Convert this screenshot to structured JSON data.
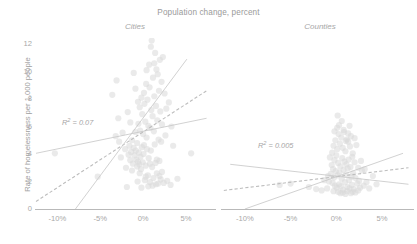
{
  "chart_data": {
    "type": "scatter",
    "title": "Population change, percent",
    "xlabel": "Population change, percent",
    "ylabel": "Rate of homelessness per 1,000 people",
    "xlim": [
      -12.5,
      8.5
    ],
    "ylim": [
      0,
      12.8
    ],
    "grid": false,
    "legend": "none",
    "xticks": [
      "-10%",
      "-5%",
      "0%",
      "5%"
    ],
    "xtick_values": [
      -10,
      -5,
      0,
      5
    ],
    "yticks": [
      "0",
      "2",
      "4",
      "6",
      "8",
      "10",
      "12"
    ],
    "ytick_values": [
      0,
      2,
      4,
      6,
      8,
      10,
      12
    ],
    "point_color": "#d8d8d8",
    "line_color": "#c9c9c9",
    "dash_line_color": "#bdbdbd",
    "panels": [
      {
        "name": "cities",
        "label": "Cities",
        "annotation": "R² = 0.07",
        "annotation_prefix": "R",
        "annotation_sup": "2",
        "annotation_suffix": " = 0.07",
        "r_squared": 0.07,
        "lines": [
          {
            "name": "shallow-fit",
            "style": "solid",
            "x0": -12.5,
            "y0": 4.05,
            "x1": 7.4,
            "y1": 6.6
          },
          {
            "name": "ols-fit",
            "style": "dashed",
            "x0": -12.5,
            "y0": 0.55,
            "x1": 7.4,
            "y1": 8.6
          },
          {
            "name": "steep-fit",
            "style": "solid",
            "x0": -7.9,
            "y0": 0.0,
            "x1": 5.1,
            "y1": 10.9
          }
        ],
        "points": [
          [
            -10.3,
            4.05
          ],
          [
            -5.3,
            2.35
          ],
          [
            -3.6,
            8.3
          ],
          [
            -3.2,
            5.3
          ],
          [
            -3.1,
            9.35
          ],
          [
            -2.9,
            6.6
          ],
          [
            -2.6,
            3.75
          ],
          [
            -2.4,
            5.55
          ],
          [
            -2.1,
            4.35
          ],
          [
            -1.9,
            1.6
          ],
          [
            -1.8,
            7.05
          ],
          [
            -1.7,
            3.95
          ],
          [
            -1.6,
            4.6
          ],
          [
            -1.5,
            3.55
          ],
          [
            -1.4,
            4.15
          ],
          [
            -1.3,
            5.0
          ],
          [
            -1.2,
            3.3
          ],
          [
            -1.1,
            4.45
          ],
          [
            -1.0,
            3.9
          ],
          [
            -0.9,
            8.75
          ],
          [
            -0.85,
            4.25
          ],
          [
            -0.8,
            3.6
          ],
          [
            -0.7,
            4.8
          ],
          [
            -0.65,
            2.0
          ],
          [
            -0.6,
            3.45
          ],
          [
            -0.55,
            6.2
          ],
          [
            -0.5,
            4.1
          ],
          [
            -0.45,
            3.25
          ],
          [
            -0.4,
            7.4
          ],
          [
            -0.35,
            5.7
          ],
          [
            -0.3,
            3.8
          ],
          [
            -0.25,
            2.9
          ],
          [
            -0.2,
            8.1
          ],
          [
            -0.15,
            4.5
          ],
          [
            -0.1,
            6.9
          ],
          [
            -0.05,
            3.4
          ],
          [
            0.0,
            5.45
          ],
          [
            0.05,
            4.0
          ],
          [
            0.1,
            8.45
          ],
          [
            0.15,
            7.65
          ],
          [
            0.2,
            2.1
          ],
          [
            0.25,
            6.35
          ],
          [
            0.3,
            3.15
          ],
          [
            0.35,
            9.1
          ],
          [
            0.4,
            5.2
          ],
          [
            0.45,
            4.35
          ],
          [
            0.5,
            7.95
          ],
          [
            0.55,
            2.45
          ],
          [
            0.6,
            6.05
          ],
          [
            0.65,
            3.7
          ],
          [
            0.7,
            10.5
          ],
          [
            0.75,
            8.85
          ],
          [
            0.8,
            1.95
          ],
          [
            0.85,
            5.9
          ],
          [
            0.9,
            4.25
          ],
          [
            0.95,
            7.2
          ],
          [
            1.0,
            12.25
          ],
          [
            1.05,
            3.05
          ],
          [
            1.1,
            6.75
          ],
          [
            1.15,
            9.55
          ],
          [
            1.2,
            2.25
          ],
          [
            1.25,
            5.65
          ],
          [
            1.3,
            8.2
          ],
          [
            1.35,
            4.7
          ],
          [
            1.4,
            11.35
          ],
          [
            1.45,
            3.35
          ],
          [
            1.5,
            7.5
          ],
          [
            1.55,
            10.15
          ],
          [
            1.6,
            2.6
          ],
          [
            1.65,
            6.45
          ],
          [
            1.7,
            9.8
          ],
          [
            1.75,
            1.85
          ],
          [
            1.8,
            5.05
          ],
          [
            1.85,
            8.6
          ],
          [
            1.9,
            3.5
          ],
          [
            1.95,
            10.85
          ],
          [
            2.0,
            7.1
          ],
          [
            2.05,
            2.15
          ],
          [
            2.1,
            4.9
          ],
          [
            2.15,
            9.25
          ],
          [
            2.2,
            6.15
          ],
          [
            2.3,
            11.05
          ],
          [
            2.4,
            1.9
          ],
          [
            2.5,
            8.4
          ],
          [
            2.6,
            5.35
          ],
          [
            2.8,
            2.05
          ],
          [
            3.0,
            7.75
          ],
          [
            3.2,
            1.75
          ],
          [
            3.5,
            4.6
          ],
          [
            4.0,
            2.2
          ],
          [
            5.6,
            4.05
          ],
          [
            0.6,
            1.65
          ],
          [
            1.1,
            1.7
          ],
          [
            1.5,
            1.8
          ],
          [
            -0.2,
            1.55
          ],
          [
            -1.3,
            2.8
          ],
          [
            -0.4,
            2.6
          ],
          [
            0.3,
            2.35
          ],
          [
            1.9,
            2.4
          ],
          [
            2.2,
            2.7
          ],
          [
            -2.0,
            3.0
          ],
          [
            -0.7,
            3.1
          ],
          [
            0.8,
            3.3
          ],
          [
            1.6,
            3.6
          ],
          [
            -1.1,
            9.9
          ],
          [
            0.4,
            10.1
          ],
          [
            1.3,
            10.6
          ],
          [
            0.9,
            11.8
          ],
          [
            -0.6,
            7.8
          ],
          [
            -1.5,
            6.3
          ],
          [
            2.7,
            7.3
          ],
          [
            -2.8,
            4.9
          ],
          [
            3.3,
            6.0
          ],
          [
            -0.9,
            5.6
          ],
          [
            0.1,
            4.65
          ]
        ]
      },
      {
        "name": "counties",
        "label": "Counties",
        "annotation": "R² = 0.005",
        "annotation_prefix": "R",
        "annotation_sup": "2",
        "annotation_suffix": " = 0.005",
        "r_squared": 0.005,
        "lines": [
          {
            "name": "shallow-fit",
            "style": "solid",
            "x0": -11.6,
            "y0": 3.25,
            "x1": 7.9,
            "y1": 1.8
          },
          {
            "name": "ols-fit",
            "style": "dashed",
            "x0": -12.3,
            "y0": 1.35,
            "x1": 7.9,
            "y1": 3.0
          },
          {
            "name": "steep-fit",
            "style": "solid",
            "x0": -10.0,
            "y0": 0.0,
            "x1": 7.3,
            "y1": 4.05
          }
        ],
        "points": [
          [
            -6.2,
            1.75
          ],
          [
            -5.0,
            1.85
          ],
          [
            -3.0,
            1.6
          ],
          [
            -2.2,
            1.45
          ],
          [
            -1.6,
            1.35
          ],
          [
            -1.0,
            1.5
          ],
          [
            -0.8,
            2.0
          ],
          [
            -0.6,
            2.55
          ],
          [
            -0.5,
            3.2
          ],
          [
            -0.45,
            4.1
          ],
          [
            -0.4,
            1.9
          ],
          [
            -0.35,
            2.9
          ],
          [
            -0.3,
            4.6
          ],
          [
            -0.25,
            2.3
          ],
          [
            -0.2,
            3.55
          ],
          [
            -0.15,
            1.7
          ],
          [
            -0.1,
            5.0
          ],
          [
            -0.05,
            2.75
          ],
          [
            0.0,
            3.9
          ],
          [
            0.05,
            1.55
          ],
          [
            0.1,
            4.35
          ],
          [
            0.15,
            2.45
          ],
          [
            0.2,
            3.35
          ],
          [
            0.25,
            5.45
          ],
          [
            0.3,
            1.8
          ],
          [
            0.35,
            2.65
          ],
          [
            0.4,
            4.75
          ],
          [
            0.45,
            3.1
          ],
          [
            0.5,
            1.65
          ],
          [
            0.55,
            5.2
          ],
          [
            0.6,
            2.2
          ],
          [
            0.65,
            3.7
          ],
          [
            0.7,
            4.45
          ],
          [
            0.75,
            1.4
          ],
          [
            0.8,
            2.85
          ],
          [
            0.85,
            5.6
          ],
          [
            0.9,
            3.45
          ],
          [
            0.95,
            1.95
          ],
          [
            1.0,
            4.2
          ],
          [
            1.05,
            2.5
          ],
          [
            1.1,
            3.25
          ],
          [
            1.15,
            5.05
          ],
          [
            1.2,
            1.6
          ],
          [
            1.25,
            2.95
          ],
          [
            1.3,
            4.9
          ],
          [
            1.35,
            3.6
          ],
          [
            1.4,
            2.1
          ],
          [
            1.45,
            1.5
          ],
          [
            1.5,
            4.55
          ],
          [
            1.55,
            3.05
          ],
          [
            1.6,
            5.3
          ],
          [
            1.65,
            2.35
          ],
          [
            1.7,
            1.75
          ],
          [
            1.75,
            3.8
          ],
          [
            1.8,
            4.05
          ],
          [
            1.85,
            2.6
          ],
          [
            1.9,
            1.45
          ],
          [
            2.0,
            3.4
          ],
          [
            2.1,
            2.25
          ],
          [
            2.2,
            4.65
          ],
          [
            2.3,
            1.85
          ],
          [
            2.4,
            3.0
          ],
          [
            2.5,
            2.05
          ],
          [
            2.6,
            1.55
          ],
          [
            2.8,
            2.8
          ],
          [
            3.0,
            1.7
          ],
          [
            3.3,
            1.95
          ],
          [
            3.6,
            1.5
          ],
          [
            4.0,
            2.4
          ],
          [
            4.4,
            1.8
          ],
          [
            0.2,
            1.25
          ],
          [
            0.7,
            1.2
          ],
          [
            1.2,
            1.3
          ],
          [
            1.8,
            1.25
          ],
          [
            2.4,
            1.35
          ],
          [
            -0.3,
            1.3
          ],
          [
            0.45,
            1.15
          ],
          [
            1.0,
            1.1
          ],
          [
            1.6,
            1.15
          ],
          [
            2.1,
            1.2
          ],
          [
            0.1,
            5.9
          ],
          [
            0.8,
            5.75
          ],
          [
            1.3,
            5.5
          ],
          [
            0.3,
            6.1
          ],
          [
            1.05,
            4.95
          ],
          [
            -0.7,
            3.75
          ],
          [
            -0.9,
            2.4
          ],
          [
            2.7,
            3.5
          ],
          [
            3.1,
            2.9
          ],
          [
            -1.3,
            2.1
          ],
          [
            0.6,
            6.4
          ],
          [
            1.45,
            6.05
          ],
          [
            0.15,
            6.8
          ],
          [
            2.0,
            5.15
          ],
          [
            -0.2,
            5.65
          ]
        ]
      }
    ]
  }
}
